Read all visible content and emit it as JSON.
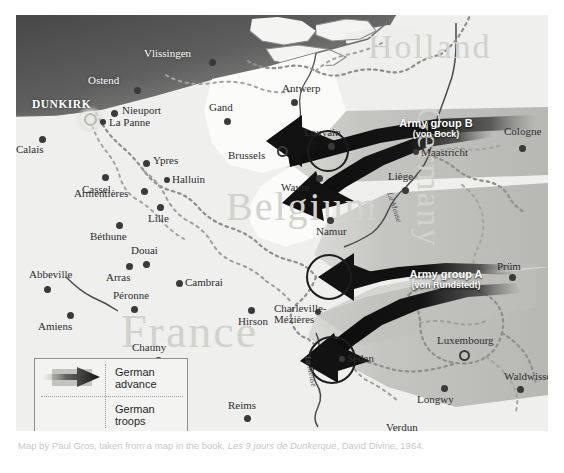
{
  "map": {
    "title": "German invasion of France and the Low Countries, May 1940",
    "countries": [
      {
        "name": "Holland"
      },
      {
        "name": "Belgium"
      },
      {
        "name": "Germany"
      },
      {
        "name": "France"
      }
    ],
    "rivers": [
      {
        "name": "La Meuse"
      },
      {
        "name": "La Meuse"
      }
    ],
    "arrows": [
      {
        "title": "Army group B",
        "commander": "(von Bock)"
      },
      {
        "title": "Army group A",
        "commander": "(von Rundstedt)"
      }
    ],
    "cities": [
      {
        "name": "Vlissingen",
        "type": "sea-name"
      },
      {
        "name": "Ostend",
        "type": "sea-name"
      },
      {
        "name": "DUNKIRK",
        "type": "highlight"
      },
      {
        "name": "Nieuport",
        "type": "town"
      },
      {
        "name": "La Panne",
        "type": "town"
      },
      {
        "name": "Gand",
        "type": "town"
      },
      {
        "name": "Antwerp",
        "type": "town"
      },
      {
        "name": "Calais",
        "type": "town"
      },
      {
        "name": "Ypres",
        "type": "town"
      },
      {
        "name": "Cassel",
        "type": "town"
      },
      {
        "name": "Halluin",
        "type": "town"
      },
      {
        "name": "Armentières",
        "type": "town"
      },
      {
        "name": "Lille",
        "type": "town"
      },
      {
        "name": "Béthune",
        "type": "town"
      },
      {
        "name": "Brussels",
        "type": "capital"
      },
      {
        "name": "Louvain",
        "type": "town"
      },
      {
        "name": "Wavre",
        "type": "town"
      },
      {
        "name": "Namur",
        "type": "town"
      },
      {
        "name": "Liège",
        "type": "town"
      },
      {
        "name": "Maastricht",
        "type": "town"
      },
      {
        "name": "Cologne",
        "type": "town"
      },
      {
        "name": "Douai",
        "type": "town"
      },
      {
        "name": "Arras",
        "type": "town"
      },
      {
        "name": "Cambrai",
        "type": "town"
      },
      {
        "name": "Abbeville",
        "type": "town"
      },
      {
        "name": "Péronne",
        "type": "town"
      },
      {
        "name": "Amiens",
        "type": "town"
      },
      {
        "name": "Hirson",
        "type": "town"
      },
      {
        "name": "Charleville-Mézières",
        "type": "town"
      },
      {
        "name": "Chauny",
        "type": "town"
      },
      {
        "name": "Sedan",
        "type": "town"
      },
      {
        "name": "Prüm",
        "type": "town"
      },
      {
        "name": "Luxembourg",
        "type": "capital"
      },
      {
        "name": "Waldwisse",
        "type": "town"
      },
      {
        "name": "Longwy",
        "type": "town"
      },
      {
        "name": "Reims",
        "type": "town"
      },
      {
        "name": "Verdun",
        "type": "town"
      }
    ]
  },
  "legend": {
    "advance_label": "German\nadvance",
    "advance_label_line1": "German",
    "advance_label_line2": "advance",
    "troops_label_line1": "German",
    "troops_label_line2": "troops"
  },
  "caption": {
    "prefix": "Map by Paul Gros, taken from a map in the book, ",
    "book": "Les 9 jours de Dunkerque",
    "suffix": ", David Divine, 1964."
  },
  "colors": {
    "land": "#f2f2f0",
    "sea_dark": "#4d4d4d",
    "advance_grey": "#b9b9b5",
    "arrow_black": "#141414",
    "watermark": "#d2d2cd",
    "caption": "#c9c9c4"
  }
}
